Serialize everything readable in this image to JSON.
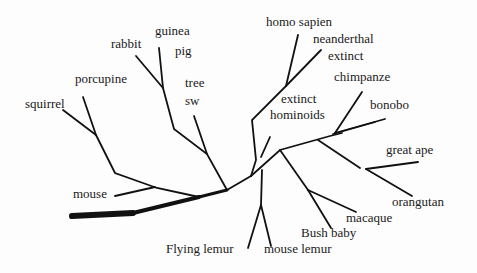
{
  "diagram": {
    "type": "phylogenetic-tree",
    "line_color": "#111111",
    "labels": {
      "squirrel": "squirrel",
      "porcupine": "porcupine",
      "rabbit": "rabbit",
      "guinea_pig_1": "guinea",
      "guinea_pig_2": "pig",
      "tree_shrew_1": "tree",
      "tree_shrew_2": "sw",
      "mouse": "mouse",
      "flying_lemur": "Flying lemur",
      "mouse_lemur": "mouse lemur",
      "bush_baby": "Bush baby",
      "macaque": "macaque",
      "orangutan": "orangutan",
      "great_ape": "great ape",
      "bonobo": "bonobo",
      "chimpanzee": "chimpanze",
      "extinct_hominoids_1": "extinct",
      "extinct_hominoids_2": "hominoids",
      "neanderthal_1": "neanderthal",
      "neanderthal_2": "extinct",
      "homo_sapien": "homo sapien"
    }
  }
}
